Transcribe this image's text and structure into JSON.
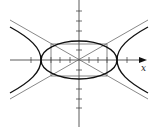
{
  "figure": {
    "x_axis_label": "x",
    "center": [
      79,
      60
    ],
    "rect_half_width": 28,
    "rect_half_height": 16,
    "ellipse_rx": 38,
    "ellipse_ry": 19,
    "hyperbola_a": 36,
    "hyperbola_b": 20,
    "colors": {
      "axis": "#333333",
      "curve": "#111111",
      "thin": "#555555"
    }
  }
}
